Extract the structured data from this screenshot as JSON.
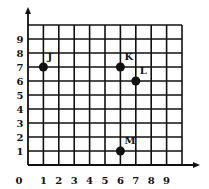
{
  "chart_data": {
    "type": "scatter",
    "title": "",
    "xlabel": "",
    "ylabel": "",
    "xlim": [
      0,
      10
    ],
    "ylim": [
      0,
      10
    ],
    "grid": true,
    "x_ticks": [
      "0",
      "1",
      "2",
      "3",
      "4",
      "5",
      "6",
      "7",
      "8",
      "9"
    ],
    "y_ticks": [
      "1",
      "2",
      "3",
      "4",
      "5",
      "6",
      "7",
      "8",
      "9"
    ],
    "points": [
      {
        "label": "J",
        "x": 1,
        "y": 7
      },
      {
        "label": "K",
        "x": 6,
        "y": 7
      },
      {
        "label": "L",
        "x": 7,
        "y": 6
      },
      {
        "label": "M",
        "x": 6,
        "y": 1
      }
    ]
  },
  "colors": {
    "grid": "#111111",
    "point": "#111111",
    "background": "#ffffff"
  }
}
